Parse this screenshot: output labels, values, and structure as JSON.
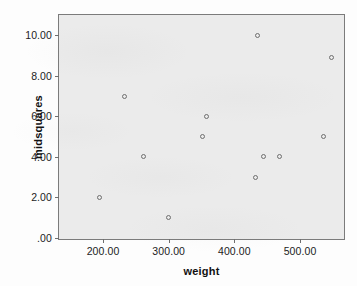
{
  "chart_data": {
    "type": "scatter",
    "title": "",
    "xlabel": "weight",
    "ylabel": "midsquares",
    "xlim": [
      133,
      570
    ],
    "ylim": [
      -0.15,
      11.0
    ],
    "grid": false,
    "legend": null,
    "xticks": [
      "200.00",
      "300.00",
      "400.00",
      "500.00"
    ],
    "xtick_values": [
      200,
      300,
      400,
      500
    ],
    "yticks": [
      ".00",
      "2.00",
      "4.00",
      "6.00",
      "8.00",
      "10.00"
    ],
    "ytick_values": [
      0,
      2,
      4,
      6,
      8,
      10
    ],
    "marker": "open-circle",
    "marker_color": "#6e6e6e",
    "plot_background": "#ebebeb",
    "frame_color": "#7b7b7b",
    "points": [
      {
        "x": 195,
        "y": 2.0
      },
      {
        "x": 232,
        "y": 7.0
      },
      {
        "x": 262,
        "y": 4.0
      },
      {
        "x": 300,
        "y": 1.0
      },
      {
        "x": 351,
        "y": 5.0
      },
      {
        "x": 357,
        "y": 6.0
      },
      {
        "x": 435,
        "y": 10.0
      },
      {
        "x": 432,
        "y": 3.0
      },
      {
        "x": 445,
        "y": 4.0
      },
      {
        "x": 468,
        "y": 4.0
      },
      {
        "x": 535,
        "y": 5.0
      },
      {
        "x": 548,
        "y": 8.9
      }
    ]
  }
}
